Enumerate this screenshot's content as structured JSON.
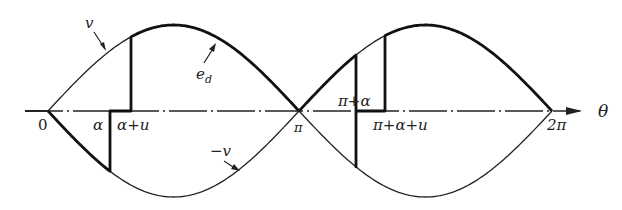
{
  "diagram": {
    "axis": {
      "label": "θ",
      "ticks": [
        {
          "label": "0",
          "x": 48
        },
        {
          "label": "α",
          "x": 110
        },
        {
          "label": "α+u",
          "x": 131
        },
        {
          "label": "π",
          "x": 299
        },
        {
          "label": "π+α",
          "x": 356
        },
        {
          "label": "π+α+u",
          "x": 385
        },
        {
          "label": "2π",
          "x": 552
        }
      ]
    },
    "curves": [
      {
        "name": "v",
        "label": "v"
      },
      {
        "name": "-v",
        "label": "-v"
      },
      {
        "name": "e_d",
        "label": "e",
        "subscript": "d"
      }
    ],
    "colors": {
      "stroke": "#1a1a1a",
      "background": "#ffffff"
    }
  },
  "labels": {
    "origin": "0",
    "alpha": "α",
    "alpha_plus_u": "α+u",
    "pi": "π",
    "pi_plus_alpha": "π+α",
    "pi_plus_alpha_plus_u": "π+α+u",
    "two_pi": "2π",
    "theta": "θ",
    "v": "v",
    "neg_v": "−v",
    "ed_main": "e",
    "ed_sub": "d"
  }
}
